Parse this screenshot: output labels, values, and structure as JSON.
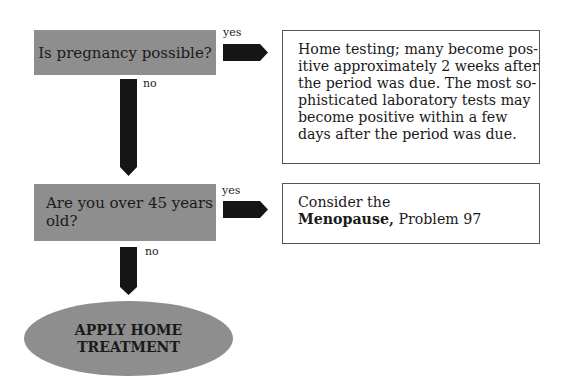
{
  "colors": {
    "box_fill": "#8e8e8e",
    "arrow_fill": "#151515",
    "border": "#555555"
  },
  "nodes": {
    "q1": {
      "text": "Is pregnancy possible?"
    },
    "q2": {
      "line1": "Are you over 45 years",
      "line2": "old?"
    },
    "a1": {
      "lines": [
        "Home testing; many become pos-",
        "itive approximately 2 weeks after",
        "the period was due. The most so-",
        "phisticated laboratory tests may",
        "become positive within a few",
        "days after the period was due."
      ]
    },
    "a2": {
      "line1": "Consider the",
      "bold": "Menopause,",
      "rest": " Problem 97"
    },
    "end": {
      "line1": "APPLY HOME",
      "line2": "TREATMENT"
    }
  },
  "labels": {
    "yes1": "yes",
    "no1": "no",
    "yes2": "yes",
    "no2": "no"
  }
}
